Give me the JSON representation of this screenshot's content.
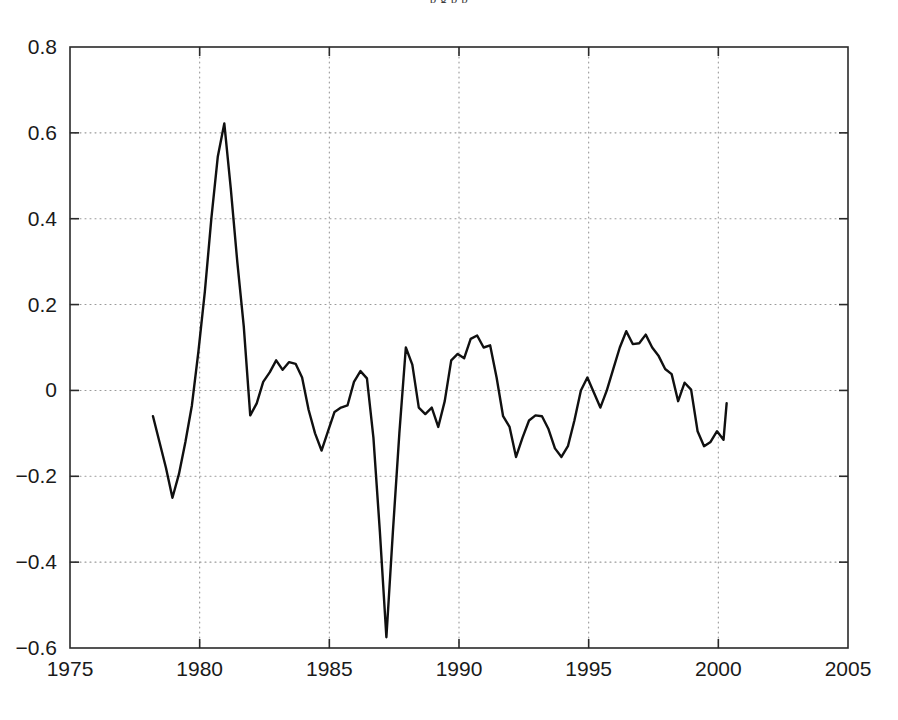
{
  "figure": {
    "cut_off_caption": "p g p p",
    "background_color": "#ffffff"
  },
  "chart_data": {
    "type": "line",
    "title": "",
    "subtitle": "",
    "xlabel": "",
    "ylabel": "",
    "xlim": [
      1975,
      2005
    ],
    "ylim": [
      -0.6,
      0.8
    ],
    "xticks": [
      1975,
      1980,
      1985,
      1990,
      1995,
      2000,
      2005
    ],
    "xtick_labels": [
      "1975",
      "1980",
      "1985",
      "1990",
      "1995",
      "2000",
      "2005"
    ],
    "yticks": [
      -0.6,
      -0.4,
      -0.2,
      0,
      0.2,
      0.4,
      0.6,
      0.8
    ],
    "ytick_labels": [
      "-0.6",
      "-0.4",
      "-0.2",
      "0",
      "0.2",
      "0.4",
      "0.6",
      "0.8"
    ],
    "grid": true,
    "grid_style": "dotted",
    "grid_color": "#9a9a9a",
    "axis_color": "#2a2a2a",
    "legend": null,
    "legend_position": "none",
    "series": [
      {
        "name": "series-1",
        "color": "#101010",
        "line_width": 2.4,
        "x": [
          1978.2,
          1978.45,
          1978.7,
          1978.95,
          1979.2,
          1979.45,
          1979.7,
          1979.95,
          1980.2,
          1980.45,
          1980.7,
          1980.95,
          1981.2,
          1981.45,
          1981.7,
          1981.95,
          1982.2,
          1982.45,
          1982.7,
          1982.95,
          1983.2,
          1983.45,
          1983.7,
          1983.95,
          1984.2,
          1984.45,
          1984.7,
          1984.95,
          1985.2,
          1985.45,
          1985.7,
          1985.95,
          1986.2,
          1986.45,
          1986.7,
          1986.95,
          1987.2,
          1987.45,
          1987.7,
          1987.95,
          1988.2,
          1988.45,
          1988.7,
          1988.95,
          1989.2,
          1989.45,
          1989.7,
          1989.95,
          1990.2,
          1990.45,
          1990.7,
          1990.95,
          1991.2,
          1991.45,
          1991.7,
          1991.95,
          1992.2,
          1992.45,
          1992.7,
          1992.95,
          1993.2,
          1993.45,
          1993.7,
          1993.95,
          1994.2,
          1994.45,
          1994.7,
          1994.95,
          1995.2,
          1995.45,
          1995.7,
          1995.95,
          1996.2,
          1996.45,
          1996.7,
          1996.95,
          1997.2,
          1997.45,
          1997.7,
          1997.95,
          1998.2,
          1998.45,
          1998.7,
          1998.95,
          1999.2,
          1999.45,
          1999.7,
          1999.95,
          2000.2,
          2000.32
        ],
        "y": [
          -0.06,
          -0.12,
          -0.18,
          -0.25,
          -0.195,
          -0.12,
          -0.035,
          0.09,
          0.23,
          0.4,
          0.545,
          0.622,
          0.47,
          0.3,
          0.15,
          -0.058,
          -0.03,
          0.02,
          0.042,
          0.07,
          0.048,
          0.066,
          0.062,
          0.03,
          -0.045,
          -0.1,
          -0.14,
          -0.095,
          -0.05,
          -0.04,
          -0.035,
          0.02,
          0.045,
          0.028,
          -0.11,
          -0.33,
          -0.575,
          -0.33,
          -0.1,
          0.1,
          0.06,
          -0.04,
          -0.055,
          -0.04,
          -0.085,
          -0.025,
          0.07,
          0.085,
          0.075,
          0.12,
          0.128,
          0.1,
          0.105,
          0.03,
          -0.06,
          -0.085,
          -0.155,
          -0.11,
          -0.07,
          -0.058,
          -0.06,
          -0.09,
          -0.135,
          -0.155,
          -0.13,
          -0.07,
          0.0,
          0.03,
          -0.005,
          -0.04,
          0.0,
          0.05,
          0.1,
          0.138,
          0.108,
          0.11,
          0.13,
          0.1,
          0.08,
          0.05,
          0.038,
          -0.025,
          0.018,
          0.002,
          -0.095,
          -0.13,
          -0.12,
          -0.095,
          -0.115,
          -0.03
        ]
      }
    ],
    "annotations": []
  }
}
